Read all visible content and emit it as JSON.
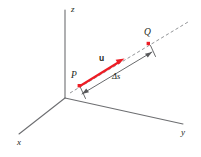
{
  "figure": {
    "background_color": "#ffffff",
    "axis_color": "#6d6e71",
    "dashed_line_color": "#939598",
    "vector_color": "#ed1c24",
    "label_color": "#231f20",
    "axes": [
      {
        "id": "z",
        "label": "z",
        "label_x": 71,
        "label_y": 5
      },
      {
        "id": "x",
        "label": "x",
        "label_x": 17,
        "label_y": 138
      },
      {
        "id": "y",
        "label": "y",
        "label_x": 181,
        "label_y": 128
      }
    ],
    "points": [
      {
        "id": "P",
        "label": "P",
        "label_x": 71,
        "label_y": 71,
        "marker_x": 79,
        "marker_y": 85
      },
      {
        "id": "Q",
        "label": "Q",
        "label_x": 144,
        "label_y": 28,
        "marker_x": 148,
        "marker_y": 43
      }
    ],
    "vector": {
      "id": "u",
      "label": "u",
      "label_x": 99,
      "label_y": 54
    },
    "arc_length": {
      "id": "delta-s",
      "label": "Δs",
      "label_x": 112,
      "label_y": 72
    }
  }
}
